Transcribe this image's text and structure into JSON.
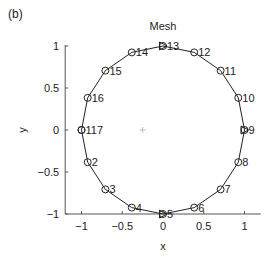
{
  "chart_data": {
    "type": "line",
    "panel_label": "(b)",
    "title": "Mesh",
    "xlabel": "x",
    "ylabel": "y",
    "xlim": [
      -1.2,
      1.2
    ],
    "ylim": [
      -1,
      1.2
    ],
    "xticks": [
      -1,
      -0.5,
      0,
      0.5,
      1
    ],
    "xtick_labels": [
      "−1",
      "−0.5",
      "0",
      "0.5",
      "1"
    ],
    "yticks": [
      -1,
      -0.5,
      0,
      0.5,
      1
    ],
    "ytick_labels": [
      "−1",
      "−0.5",
      "0",
      "0.5",
      "1"
    ],
    "grid": false,
    "series": [
      {
        "name": "mesh-boundary",
        "color": "#222222",
        "marker": "circle",
        "points": [
          {
            "node": 1,
            "x": -1.0,
            "y": 0.0,
            "label": "1"
          },
          {
            "node": 2,
            "x": -0.924,
            "y": -0.383,
            "label": "2"
          },
          {
            "node": 3,
            "x": -0.707,
            "y": -0.707,
            "label": "3"
          },
          {
            "node": 4,
            "x": -0.383,
            "y": -0.924,
            "label": "4"
          },
          {
            "node": 5,
            "x": 0.0,
            "y": -1.0,
            "label": "5",
            "triangle": true
          },
          {
            "node": 6,
            "x": 0.383,
            "y": -0.924,
            "label": "6"
          },
          {
            "node": 7,
            "x": 0.707,
            "y": -0.707,
            "label": "7"
          },
          {
            "node": 8,
            "x": 0.924,
            "y": -0.383,
            "label": "8"
          },
          {
            "node": 9,
            "x": 1.0,
            "y": 0.0,
            "label": "9",
            "triangle": true
          },
          {
            "node": 10,
            "x": 0.924,
            "y": 0.383,
            "label": "10"
          },
          {
            "node": 11,
            "x": 0.707,
            "y": 0.707,
            "label": "11"
          },
          {
            "node": 12,
            "x": 0.383,
            "y": 0.924,
            "label": "12"
          },
          {
            "node": 13,
            "x": 0.0,
            "y": 1.0,
            "label": "13",
            "triangle": true
          },
          {
            "node": 14,
            "x": -0.383,
            "y": 0.924,
            "label": "14"
          },
          {
            "node": 15,
            "x": -0.707,
            "y": 0.707,
            "label": "15"
          },
          {
            "node": 16,
            "x": -0.924,
            "y": 0.383,
            "label": "16"
          },
          {
            "node": 17,
            "x": -1.0,
            "y": 0.0,
            "label": "17"
          }
        ]
      }
    ],
    "annotations": [
      {
        "text": "+",
        "x": -0.25,
        "y": 0.0,
        "color": "#bbbbbb",
        "meaning": "center-marker"
      }
    ]
  }
}
